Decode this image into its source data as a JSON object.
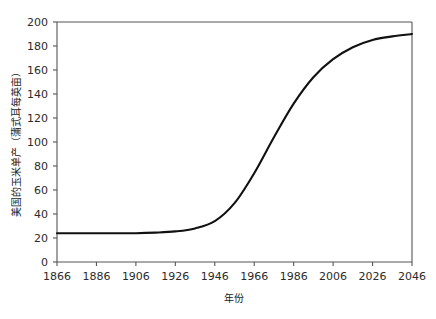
{
  "chart_data": {
    "type": "line",
    "title": "",
    "xlabel": "年份",
    "ylabel": "美国的玉米单产（蒲式耳每英亩）",
    "xlim": [
      1866,
      2046
    ],
    "ylim": [
      0,
      200
    ],
    "grid": false,
    "legend": false,
    "legend_position": "none",
    "xticks": [
      1866,
      1886,
      1906,
      1926,
      1946,
      1966,
      1986,
      2006,
      2026,
      2046
    ],
    "xtick_labels": [
      "1866",
      "1886",
      "1906",
      "1926",
      "1946",
      "1966",
      "1986",
      "2006",
      "2026",
      "2046"
    ],
    "yticks": [
      0,
      20,
      40,
      60,
      80,
      100,
      120,
      140,
      160,
      180,
      200
    ],
    "ytick_labels": [
      "0",
      "20",
      "40",
      "60",
      "80",
      "100",
      "120",
      "140",
      "160",
      "180",
      "200"
    ],
    "series": [
      {
        "name": "美国的玉米单产",
        "color": "#111111",
        "x": [
          1866,
          1876,
          1886,
          1896,
          1906,
          1916,
          1926,
          1936,
          1946,
          1956,
          1966,
          1976,
          1986,
          1996,
          2006,
          2016,
          2026,
          2036,
          2046
        ],
        "values": [
          24,
          24,
          24,
          24,
          24,
          24.5,
          25.5,
          28,
          34,
          49,
          74,
          104,
          132,
          154,
          169,
          179,
          185,
          188,
          190
        ]
      }
    ],
    "annotations": []
  },
  "axes": {
    "x_axis_name": "x-axis",
    "y_axis_name": "y-axis"
  }
}
